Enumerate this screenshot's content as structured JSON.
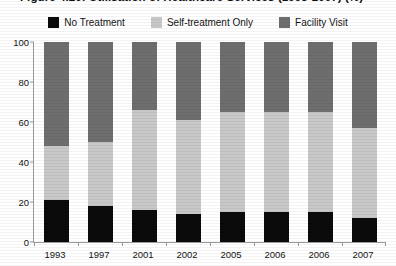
{
  "figure": {
    "title": "Figure 4.20: Utilisation of Healthcare Services (1993-2007) (%)"
  },
  "legend": {
    "items": [
      {
        "label": "No Treatment",
        "color": "#0b0b0b",
        "swatch": "legend-swatch-no-treatment"
      },
      {
        "label": "Self-treatment Only",
        "color": "#c8c8c8",
        "swatch": "legend-swatch-self-treatment"
      },
      {
        "label": "Facility Visit",
        "color": "#6e6e6e",
        "swatch": "legend-swatch-facility-visit"
      }
    ]
  },
  "axes": {
    "y_ticks": [
      "100",
      "80",
      "60",
      "40",
      "20",
      "0"
    ],
    "x_labels": [
      "1993",
      "1997",
      "2001",
      "2002",
      "2005",
      "2006",
      "2006",
      "2007"
    ]
  },
  "chart_data": {
    "type": "bar",
    "stacked": true,
    "title": "Figure 4.20: Utilisation of Healthcare Services (1993-2007) (%)",
    "xlabel": "",
    "ylabel": "",
    "ylim": [
      0,
      100
    ],
    "yticks": [
      0,
      20,
      40,
      60,
      80,
      100
    ],
    "grid": false,
    "legend_position": "top-center",
    "categories": [
      "1993",
      "1997",
      "2001",
      "2002",
      "2005",
      "2006",
      "2006",
      "2007"
    ],
    "series": [
      {
        "name": "No Treatment",
        "color": "#0b0b0b",
        "values": [
          21,
          18,
          16,
          14,
          15,
          15,
          15,
          12
        ]
      },
      {
        "name": "Self-treatment Only",
        "color": "#c8c8c8",
        "values": [
          27,
          32,
          50,
          47,
          50,
          50,
          50,
          45
        ]
      },
      {
        "name": "Facility Visit",
        "color": "#6e6e6e",
        "values": [
          52,
          50,
          34,
          39,
          35,
          35,
          35,
          43
        ]
      }
    ],
    "cumulative_tops": {
      "no_treatment": [
        21,
        18,
        16,
        14,
        15,
        15,
        15,
        12
      ],
      "self_treatment": [
        48,
        50,
        66,
        61,
        65,
        65,
        65,
        57
      ],
      "facility_visit": [
        100,
        100,
        100,
        100,
        100,
        100,
        100,
        100
      ]
    }
  }
}
